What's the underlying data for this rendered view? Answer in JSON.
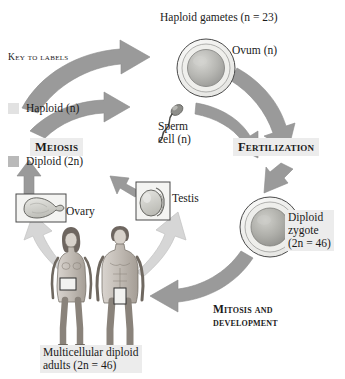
{
  "diagram": {
    "background": "#ffffff"
  },
  "key": {
    "title": "Key to labels",
    "items": [
      {
        "label": "Haploid (n)",
        "swatch_color": "#e2e2e2",
        "swatch_name": "haploid-swatch"
      },
      {
        "label": "Diploid (2n)",
        "swatch_color": "#b9b9b9",
        "swatch_name": "diploid-swatch"
      }
    ]
  },
  "labels": {
    "haploid_gametes": "Haploid gametes (n = 23)",
    "ovum": "Ovum (n)",
    "sperm": "Sperm\ncell (n)",
    "meiosis": "Meiosis",
    "fertilization": "Fertilization",
    "ovary": "Ovary",
    "testis": "Testis",
    "zygote": "Diploid\nzygote\n(2n = 46)",
    "mitosis_development": "Mitosis and\ndevelopment",
    "adults": "Multicellular diploid\nadults (2n = 46)"
  },
  "cells": {
    "ovum": {
      "name": "ovum-cell",
      "ploidy": "haploid",
      "chromosome_number": "n = 23"
    },
    "sperm": {
      "name": "sperm-cell",
      "ploidy": "haploid",
      "chromosome_number": "n"
    },
    "zygote": {
      "name": "zygote-cell",
      "ploidy": "diploid",
      "chromosome_number": "2n = 46"
    }
  },
  "organs": {
    "ovary": {
      "name": "ovary-illustration",
      "ploidy": "diploid"
    },
    "testis": {
      "name": "testis-illustration",
      "ploidy": "diploid"
    }
  },
  "organisms": {
    "female_adult": {
      "name": "female-adult-figure",
      "ploidy": "diploid"
    },
    "male_adult": {
      "name": "male-adult-figure",
      "ploidy": "diploid"
    }
  },
  "arrows": [
    {
      "name": "arrow-ovary-to-meiosis",
      "from": "ovary",
      "to": "meiosis",
      "shade": "dark"
    },
    {
      "name": "arrow-testis-to-meiosis",
      "from": "testis",
      "to": "meiosis",
      "shade": "dark"
    },
    {
      "name": "arrow-meiosis-to-ovum",
      "from": "meiosis",
      "to": "ovum",
      "shade": "dark"
    },
    {
      "name": "arrow-meiosis-to-sperm",
      "from": "meiosis",
      "to": "sperm",
      "shade": "dark"
    },
    {
      "name": "arrow-ovum-to-fertilization",
      "from": "ovum",
      "to": "fertilization",
      "shade": "dark"
    },
    {
      "name": "arrow-sperm-to-fertilization",
      "from": "sperm",
      "to": "fertilization",
      "shade": "dark"
    },
    {
      "name": "arrow-fertilization-to-zygote",
      "from": "fertilization",
      "to": "zygote",
      "shade": "dark"
    },
    {
      "name": "arrow-zygote-to-adults",
      "from": "zygote",
      "to": "adults",
      "shade": "dark"
    },
    {
      "name": "arrow-female-to-ovary",
      "from": "female-adult",
      "to": "ovary",
      "shade": "light"
    },
    {
      "name": "arrow-male-to-testis",
      "from": "male-adult",
      "to": "testis",
      "shade": "light"
    }
  ],
  "colors": {
    "arrow_dark": "#9a9a9a",
    "arrow_light": "#d2d2d2",
    "haploid_fill": "#e2e2e2",
    "diploid_fill": "#b9b9b9",
    "text": "#1a1a1a",
    "highlight_bg": "#ececec"
  }
}
